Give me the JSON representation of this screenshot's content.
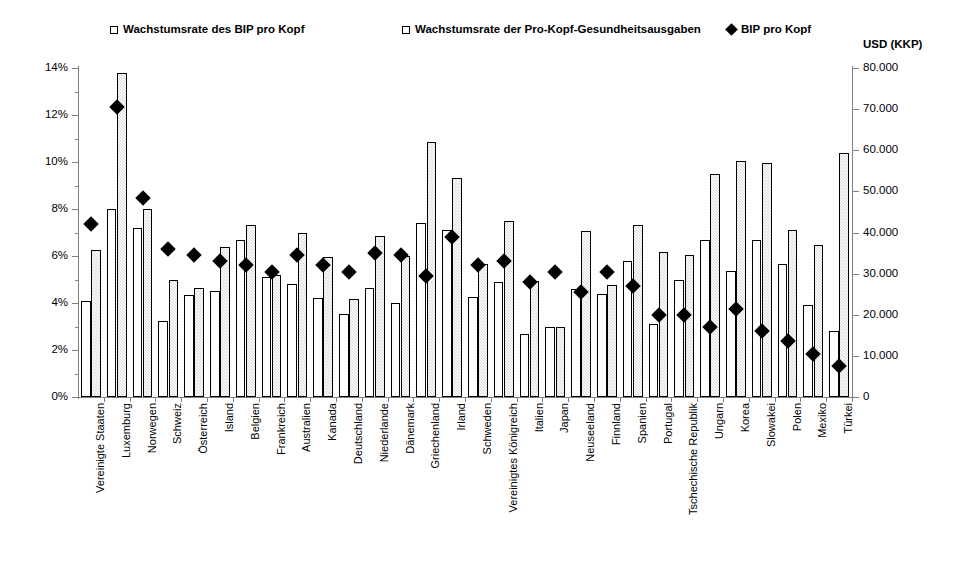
{
  "legend": {
    "items": [
      {
        "label": "Wachstumsrate des BIP pro Kopf",
        "marker": "white-square-icon"
      },
      {
        "label": "Wachstumsrate der Pro-Kopf-Gesundheitsausgaben",
        "marker": "hatched-square-icon"
      },
      {
        "label": "BIP pro Kopf",
        "marker": "black-diamond-icon"
      }
    ]
  },
  "axes": {
    "right_title": "USD (KKP)",
    "left_ticks": [
      "0%",
      "2%",
      "4%",
      "6%",
      "8%",
      "10%",
      "12%",
      "14%"
    ],
    "right_ticks": [
      "0",
      "10.000",
      "20.000",
      "30.000",
      "40.000",
      "50.000",
      "60.000",
      "70.000",
      "80.000"
    ]
  },
  "chart_data": {
    "type": "bar",
    "title": "",
    "xlabel": "",
    "ylabel": "",
    "ylim": [
      0,
      14
    ],
    "y2lim": [
      0,
      80000
    ],
    "ylabel_right": "USD (KKP)",
    "grid": false,
    "legend_position": "top",
    "categories": [
      "Vereinigte Staaten",
      "Luxemburg",
      "Norwegen",
      "Schweiz",
      "Österreich",
      "Island",
      "Belgien",
      "Frankreich",
      "Australien",
      "Kanada",
      "Deutschland",
      "Niederlande",
      "Dänemark",
      "Griechenland",
      "Irland",
      "Schweden",
      "Vereinigtes Königreich",
      "Italien",
      "Japan",
      "Neuseeland",
      "Finnland",
      "Spanien",
      "Portugal",
      "Tschechische Republik",
      "Ungarn",
      "Korea",
      "Slowakei",
      "Polen",
      "Mexiko",
      "Türkei"
    ],
    "series": [
      {
        "name": "Wachstumsrate des BIP pro Kopf",
        "axis": "left",
        "unit": "%",
        "values": [
          4.1,
          8.0,
          7.2,
          3.25,
          4.35,
          4.5,
          6.7,
          5.1,
          4.8,
          4.2,
          3.55,
          4.65,
          4.0,
          7.4,
          7.1,
          4.25,
          4.9,
          2.7,
          3.0,
          4.6,
          4.4,
          5.8,
          3.1,
          5.0,
          6.7,
          5.35,
          6.7,
          5.65,
          3.9,
          2.8
        ]
      },
      {
        "name": "Wachstumsrate der Pro-Kopf-Gesundheitsausgaben",
        "axis": "left",
        "unit": "%",
        "values": [
          6.25,
          13.8,
          8.0,
          5.0,
          4.65,
          6.4,
          7.3,
          5.2,
          7.0,
          5.95,
          4.15,
          6.85,
          6.0,
          10.85,
          9.3,
          5.65,
          7.5,
          4.95,
          3.0,
          7.05,
          4.75,
          7.3,
          6.15,
          6.05,
          9.5,
          10.05,
          9.95,
          7.1,
          6.45,
          10.4
        ]
      },
      {
        "name": "BIP pro Kopf",
        "axis": "right",
        "unit": "USD (KKP)",
        "values": [
          42000,
          70500,
          48500,
          36000,
          34500,
          33000,
          32000,
          30500,
          34500,
          32000,
          30500,
          35000,
          34500,
          29500,
          39000,
          32000,
          33000,
          28000,
          30500,
          25500,
          30500,
          27000,
          20000,
          20000,
          17000,
          21500,
          16000,
          13500,
          10500,
          7500
        ]
      }
    ]
  }
}
